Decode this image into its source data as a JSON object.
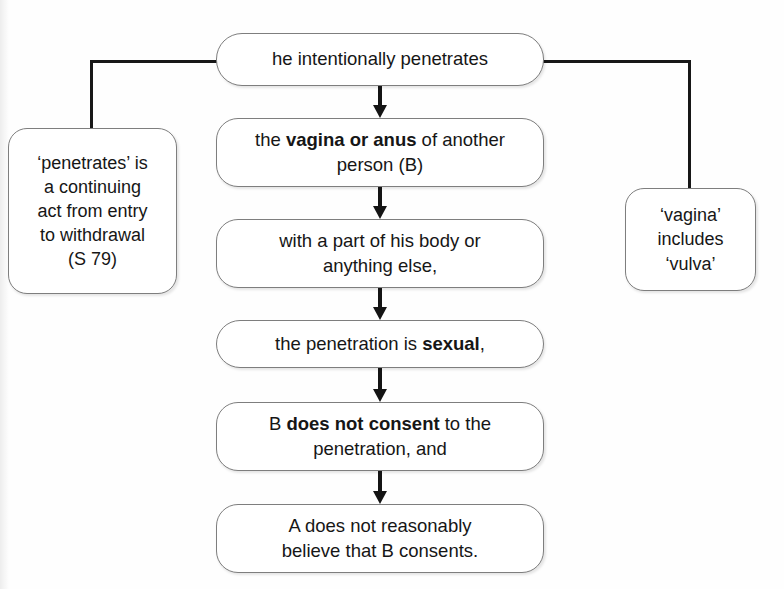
{
  "diagram": {
    "type": "flowchart",
    "orientation": "vertical",
    "clipped_caption": "",
    "colors": {
      "background": "#ffffff",
      "box_fill": "#ffffff",
      "box_border": "#7e7e7e",
      "connector": "#171717",
      "text": "#161616"
    }
  },
  "nodes": {
    "penetrates": {
      "id": "node-penetrates",
      "text": "he intentionally penetrates",
      "lines": [
        "he intentionally penetrates"
      ],
      "bold_terms": []
    },
    "vagina_anus": {
      "id": "node-vagina-anus",
      "text": "the vagina or anus of another person (B)",
      "line1_pre": "the ",
      "line1_bold": "vagina or anus",
      "line1_post": " of another",
      "line2": "person (B)",
      "bold_terms": [
        "vagina or anus"
      ]
    },
    "body_part": {
      "id": "node-body-part",
      "text": "with a part of his body or anything else,",
      "line1": "with a part of his body or",
      "line2": "anything else,",
      "bold_terms": []
    },
    "sexual": {
      "id": "node-sexual",
      "text": "the penetration is sexual,",
      "line1_pre": "the penetration is ",
      "line1_bold": "sexual",
      "line1_post": ",",
      "bold_terms": [
        "sexual"
      ]
    },
    "consent": {
      "id": "node-consent",
      "text": "B does not consent to the penetration, and",
      "line1_pre": "B ",
      "line1_bold": "does not consent",
      "line1_post": " to the",
      "line2": "penetration, and",
      "bold_terms": [
        "does not consent"
      ]
    },
    "belief": {
      "id": "node-belief",
      "text": "A does not reasonably believe that B consents.",
      "line1": "A does not reasonably",
      "line2": "believe that B consents.",
      "bold_terms": []
    }
  },
  "notes": {
    "left": {
      "id": "node-note-left",
      "text": "'penetrates' is a continuing act from entry to withdrawal (S 79)",
      "lines": [
        "‘penetrates’ is",
        "a continuing",
        "act from entry",
        "to withdrawal",
        "(S 79)"
      ],
      "attached_to": "penetrates",
      "statute_reference": "S 79"
    },
    "right": {
      "id": "node-note-right",
      "text": "'vagina' includes 'vulva'",
      "lines": [
        "‘vagina’",
        "includes",
        "‘vulva’"
      ],
      "attached_to": "penetrates"
    }
  },
  "connectors": [
    {
      "name": "penetrates-to-vagina-anus",
      "from": "penetrates",
      "to": "vagina_anus",
      "style": "arrow-down"
    },
    {
      "name": "vagina-anus-to-body-part",
      "from": "vagina_anus",
      "to": "body_part",
      "style": "arrow-down"
    },
    {
      "name": "body-part-to-sexual",
      "from": "body_part",
      "to": "sexual",
      "style": "arrow-down"
    },
    {
      "name": "sexual-to-consent",
      "from": "sexual",
      "to": "consent",
      "style": "arrow-down"
    },
    {
      "name": "consent-to-belief",
      "from": "consent",
      "to": "belief",
      "style": "arrow-down"
    },
    {
      "name": "penetrates-to-left-note",
      "from": "penetrates",
      "to": "notes.left",
      "style": "elbow-left"
    },
    {
      "name": "penetrates-to-right-note",
      "from": "penetrates",
      "to": "notes.right",
      "style": "elbow-right"
    }
  ]
}
